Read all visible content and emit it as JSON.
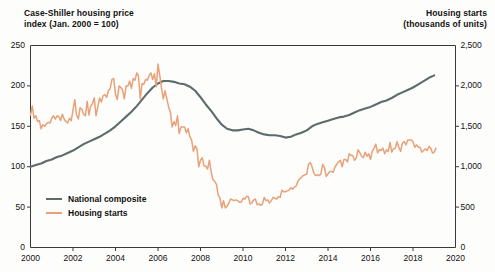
{
  "chart_data": {
    "type": "line",
    "title": "",
    "left_axis": {
      "label": "Case-Shiller housing price index (Jan. 2000 = 100)",
      "label_line1": "Case-Shiller housing price",
      "label_line2": "index (Jan. 2000 = 100)",
      "ticks": [
        0,
        50,
        100,
        150,
        200,
        250
      ],
      "tick_labels": [
        "0",
        "50",
        "100",
        "150",
        "200",
        "250"
      ],
      "ylim": [
        0,
        250
      ]
    },
    "right_axis": {
      "label": "Housing starts (thousands of units)",
      "label_line1": "Housing starts",
      "label_line2": "(thousands of units)",
      "ticks": [
        0,
        500,
        1000,
        1500,
        2000,
        2500
      ],
      "tick_labels": [
        "0",
        "500",
        "1,000",
        "1,500",
        "2,000",
        "2,500"
      ],
      "ylim": [
        0,
        2500
      ]
    },
    "xlabel": "",
    "xlim": [
      2000,
      2020
    ],
    "x_ticks": [
      2000,
      2002,
      2004,
      2006,
      2008,
      2010,
      2012,
      2014,
      2016,
      2018,
      2020
    ],
    "x_tick_labels": [
      "2000",
      "2002",
      "2004",
      "2006",
      "2008",
      "2010",
      "2012",
      "2014",
      "2016",
      "2018",
      "2020"
    ],
    "grid": false,
    "legend_position": "inside-lower-left",
    "series": [
      {
        "name": "National composite",
        "axis": "left",
        "color": "#5c6c6c",
        "x": [
          2000.0,
          2000.25,
          2000.5,
          2000.75,
          2001.0,
          2001.25,
          2001.5,
          2001.75,
          2002.0,
          2002.25,
          2002.5,
          2002.75,
          2003.0,
          2003.25,
          2003.5,
          2003.75,
          2004.0,
          2004.25,
          2004.5,
          2004.75,
          2005.0,
          2005.25,
          2005.5,
          2005.75,
          2006.0,
          2006.25,
          2006.5,
          2006.75,
          2007.0,
          2007.25,
          2007.5,
          2007.75,
          2008.0,
          2008.25,
          2008.5,
          2008.75,
          2009.0,
          2009.25,
          2009.5,
          2009.75,
          2010.0,
          2010.25,
          2010.5,
          2010.75,
          2011.0,
          2011.25,
          2011.5,
          2011.75,
          2012.0,
          2012.25,
          2012.5,
          2012.75,
          2013.0,
          2013.25,
          2013.5,
          2013.75,
          2014.0,
          2014.25,
          2014.5,
          2014.75,
          2015.0,
          2015.25,
          2015.5,
          2015.75,
          2016.0,
          2016.25,
          2016.5,
          2016.75,
          2017.0,
          2017.25,
          2017.5,
          2017.75,
          2018.0,
          2018.25,
          2018.5,
          2018.75,
          2019.0
        ],
        "values": [
          100,
          102,
          104,
          107,
          109,
          112,
          114,
          117,
          120,
          124,
          128,
          131,
          134,
          137,
          141,
          145,
          150,
          156,
          162,
          168,
          175,
          183,
          191,
          198,
          203,
          206,
          206,
          205,
          203,
          202,
          199,
          194,
          186,
          177,
          169,
          160,
          152,
          147,
          145,
          145,
          146,
          147,
          145,
          142,
          140,
          139,
          139,
          138,
          136,
          137,
          140,
          142,
          145,
          150,
          153,
          155,
          157,
          159,
          161,
          162,
          164,
          167,
          170,
          172,
          174,
          177,
          180,
          182,
          185,
          189,
          192,
          195,
          198,
          202,
          206,
          210,
          213
        ],
        "start_value": 100,
        "peak_value": 206,
        "peak_year": 2006,
        "trough_value": 136,
        "trough_year": 2012,
        "end_value": 215
      },
      {
        "name": "Housing starts",
        "axis": "right",
        "color": "#e8a178",
        "x": [
          2000.0,
          2000.083,
          2000.167,
          2000.25,
          2000.333,
          2000.417,
          2000.5,
          2000.583,
          2000.667,
          2000.75,
          2000.833,
          2000.917,
          2001.0,
          2001.083,
          2001.167,
          2001.25,
          2001.333,
          2001.417,
          2001.5,
          2001.583,
          2001.667,
          2001.75,
          2001.833,
          2001.917,
          2002.0,
          2002.083,
          2002.167,
          2002.25,
          2002.333,
          2002.417,
          2002.5,
          2002.583,
          2002.667,
          2002.75,
          2002.833,
          2002.917,
          2003.0,
          2003.083,
          2003.167,
          2003.25,
          2003.333,
          2003.417,
          2003.5,
          2003.583,
          2003.667,
          2003.75,
          2003.833,
          2003.917,
          2004.0,
          2004.083,
          2004.167,
          2004.25,
          2004.333,
          2004.417,
          2004.5,
          2004.583,
          2004.667,
          2004.75,
          2004.833,
          2004.917,
          2005.0,
          2005.083,
          2005.167,
          2005.25,
          2005.333,
          2005.417,
          2005.5,
          2005.583,
          2005.667,
          2005.75,
          2005.833,
          2005.917,
          2006.0,
          2006.083,
          2006.167,
          2006.25,
          2006.333,
          2006.417,
          2006.5,
          2006.583,
          2006.667,
          2006.75,
          2006.833,
          2006.917,
          2007.0,
          2007.083,
          2007.167,
          2007.25,
          2007.333,
          2007.417,
          2007.5,
          2007.583,
          2007.667,
          2007.75,
          2007.833,
          2007.917,
          2008.0,
          2008.083,
          2008.167,
          2008.25,
          2008.333,
          2008.417,
          2008.5,
          2008.583,
          2008.667,
          2008.75,
          2008.833,
          2008.917,
          2009.0,
          2009.083,
          2009.167,
          2009.25,
          2009.333,
          2009.417,
          2009.5,
          2009.583,
          2009.667,
          2009.75,
          2009.833,
          2009.917,
          2010.0,
          2010.083,
          2010.167,
          2010.25,
          2010.333,
          2010.417,
          2010.5,
          2010.583,
          2010.667,
          2010.75,
          2010.833,
          2010.917,
          2011.0,
          2011.083,
          2011.167,
          2011.25,
          2011.333,
          2011.417,
          2011.5,
          2011.583,
          2011.667,
          2011.75,
          2011.833,
          2011.917,
          2012.0,
          2012.083,
          2012.167,
          2012.25,
          2012.333,
          2012.417,
          2012.5,
          2012.583,
          2012.667,
          2012.75,
          2012.833,
          2012.917,
          2013.0,
          2013.083,
          2013.167,
          2013.25,
          2013.333,
          2013.417,
          2013.5,
          2013.583,
          2013.667,
          2013.75,
          2013.833,
          2013.917,
          2014.0,
          2014.083,
          2014.167,
          2014.25,
          2014.333,
          2014.417,
          2014.5,
          2014.583,
          2014.667,
          2014.75,
          2014.833,
          2014.917,
          2015.0,
          2015.083,
          2015.167,
          2015.25,
          2015.333,
          2015.417,
          2015.5,
          2015.583,
          2015.667,
          2015.75,
          2015.833,
          2015.917,
          2016.0,
          2016.083,
          2016.167,
          2016.25,
          2016.333,
          2016.417,
          2016.5,
          2016.583,
          2016.667,
          2016.75,
          2016.833,
          2016.917,
          2017.0,
          2017.083,
          2017.167,
          2017.25,
          2017.333,
          2017.417,
          2017.5,
          2017.583,
          2017.667,
          2017.75,
          2017.833,
          2017.917,
          2018.0,
          2018.083,
          2018.167,
          2018.25,
          2018.333,
          2018.417,
          2018.5,
          2018.583,
          2018.667,
          2018.75,
          2018.833,
          2018.917,
          2019.0,
          2019.083
        ],
        "values": [
          1640,
          1750,
          1600,
          1630,
          1560,
          1570,
          1470,
          1520,
          1500,
          1530,
          1550,
          1540,
          1600,
          1630,
          1590,
          1630,
          1620,
          1570,
          1650,
          1590,
          1560,
          1540,
          1600,
          1570,
          1700,
          1830,
          1640,
          1590,
          1730,
          1710,
          1650,
          1630,
          1810,
          1640,
          1750,
          1780,
          1850,
          1630,
          1740,
          1850,
          1800,
          1880,
          1890,
          1860,
          1940,
          1970,
          2080,
          2090,
          1900,
          1830,
          2000,
          1980,
          1950,
          1840,
          2000,
          2000,
          2060,
          1970,
          2090,
          2070,
          2160,
          2120,
          1840,
          2030,
          2020,
          2080,
          2070,
          2130,
          2160,
          2080,
          2150,
          1990,
          2270,
          2130,
          1970,
          1840,
          1940,
          1840,
          1740,
          1670,
          1490,
          1560,
          1510,
          1630,
          1410,
          1490,
          1490,
          1490,
          1420,
          1470,
          1370,
          1330,
          1190,
          1260,
          1220,
          1000,
          1080,
          1110,
          1010,
          1010,
          970,
          1080,
          940,
          840,
          820,
          780,
          650,
          610,
          490,
          580,
          490,
          510,
          550,
          600,
          590,
          580,
          590,
          580,
          560,
          560,
          610,
          600,
          630,
          630,
          540,
          550,
          590,
          600,
          530,
          540,
          520,
          540,
          620,
          580,
          590,
          550,
          580,
          620,
          610,
          600,
          630,
          620,
          710,
          690,
          690,
          700,
          710,
          740,
          720,
          750,
          760,
          820,
          850,
          870,
          890,
          900,
          910,
          1030,
          1050,
          1000,
          920,
          890,
          900,
          890,
          910,
          1030,
          990,
          880,
          910,
          940,
          940,
          930,
          1000,
          1030,
          1060,
          1080,
          1000,
          1090,
          1090,
          1060,
          1160,
          1140,
          1140,
          1080,
          1110,
          1210,
          1170,
          1130,
          1110,
          1180,
          1130,
          1160,
          1090,
          1190,
          1230,
          1280,
          1170,
          1210,
          1200,
          1230,
          1160,
          1210,
          1190,
          1300,
          1180,
          1220,
          1230,
          1310,
          1240,
          1190,
          1290,
          1310,
          1270,
          1330,
          1330,
          1330,
          1310,
          1240,
          1270,
          1240,
          1240,
          1180,
          1200,
          1220,
          1200,
          1250,
          1230,
          1170,
          1180,
          1230
        ],
        "start_value": 1640,
        "peak_value": 2270,
        "peak_year": 2006,
        "trough_value": 490,
        "trough_year": 2009,
        "end_value": 1230
      }
    ],
    "legend": [
      {
        "label": "National composite",
        "color": "#5c6c6c"
      },
      {
        "label": "Housing starts",
        "color": "#e8a178"
      }
    ]
  }
}
